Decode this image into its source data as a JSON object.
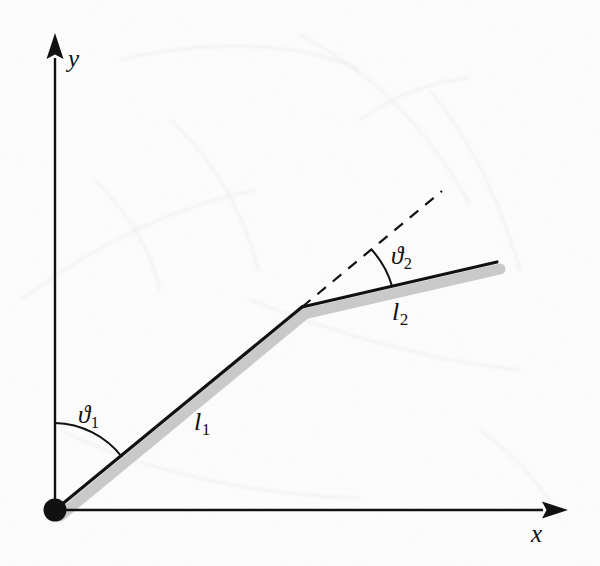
{
  "figure": {
    "background_color": "#fdfdfd",
    "ink_color": "#111111",
    "shadow_color": "#c9c9c9"
  },
  "axes": {
    "x_axis": {
      "label": "x",
      "icon": "arrow-right-icon",
      "start": [
        55,
        510
      ],
      "end": [
        555,
        510
      ]
    },
    "y_axis": {
      "label": "y",
      "icon": "arrow-up-icon",
      "start": [
        55,
        510
      ],
      "end": [
        55,
        47
      ]
    },
    "origin": {
      "name": "origin-joint",
      "position": [
        55,
        510
      ],
      "radius": 11
    }
  },
  "links": [
    {
      "label": "l",
      "subscript": "1",
      "start": [
        55,
        510
      ],
      "end": [
        302,
        307
      ],
      "label_position": [
        203,
        425
      ]
    },
    {
      "label": "l",
      "subscript": "2",
      "start": [
        302,
        307
      ],
      "end": [
        497,
        262
      ],
      "label_position": [
        403,
        315
      ]
    }
  ],
  "joints": {
    "elbow": {
      "name": "elbow-joint",
      "position": [
        302,
        307
      ]
    }
  },
  "dashed_extension": {
    "name": "link1-extension-dashed",
    "start": [
      302,
      307
    ],
    "end": [
      442,
      191
    ]
  },
  "angles": [
    {
      "label": "ϑ",
      "subscript": "1",
      "vertex": [
        55,
        510
      ],
      "from": "y-axis",
      "to": "link-1",
      "arc_radius": 87,
      "label_position": [
        93,
        418
      ]
    },
    {
      "label": "ϑ",
      "subscript": "2",
      "vertex": [
        302,
        307
      ],
      "from": "link-1-extension",
      "to": "link-2",
      "arc_radius": 92,
      "label_position": [
        403,
        260
      ]
    }
  ]
}
